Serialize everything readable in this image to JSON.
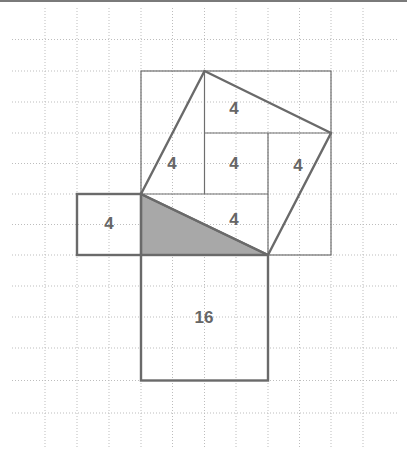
{
  "diagram": {
    "type": "pythagorean-grid-proof",
    "colors": {
      "grid": "#bdbdbd",
      "lines": "#6a6a6a",
      "shaded_triangle": "#a8a8a8",
      "labels": "#666666"
    },
    "labels": {
      "top_square": "4",
      "left_tilted": "4",
      "center_square": "4",
      "right_tilted": "4",
      "bottom_inner": "4",
      "small_left_square": "4",
      "large_bottom_square": "16"
    }
  }
}
